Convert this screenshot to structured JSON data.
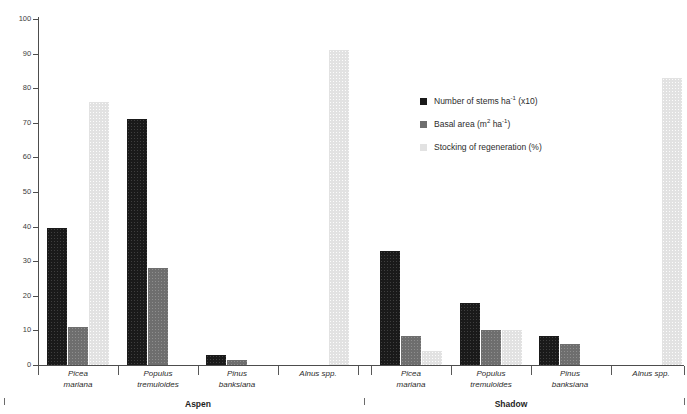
{
  "chart_data": {
    "type": "bar",
    "title": "",
    "xlabel": "",
    "ylabel": "",
    "ylim": [
      0,
      100
    ],
    "y_ticks": [
      0,
      10,
      20,
      30,
      40,
      50,
      60,
      70,
      80,
      90,
      100
    ],
    "grid": false,
    "legend_position": "upper-center-right",
    "categories": [
      "Picea mariana",
      "Populus tremuloides",
      "Pinus banksiana",
      "Alnus spp.",
      "Picea mariana",
      "Populus tremuloides",
      "Pinus banksiana",
      "Alnus spp."
    ],
    "groups": [
      {
        "label": "Aspen",
        "categories": [
          "Picea mariana",
          "Populus tremuloides",
          "Pinus banksiana",
          "Alnus spp."
        ]
      },
      {
        "label": "Shadow",
        "categories": [
          "Picea mariana",
          "Populus tremuloides",
          "Pinus banksiana",
          "Alnus spp."
        ]
      }
    ],
    "series": [
      {
        "name": "Number of stems ha-1 (x10)",
        "color": "#1a1a1a",
        "values": [
          39.5,
          71,
          3,
          0,
          33,
          18,
          8.5,
          0
        ]
      },
      {
        "name": "Basal area (m2 ha-1)",
        "color": "#6e6e6e",
        "values": [
          11,
          28,
          1.5,
          0,
          8.5,
          10,
          6,
          0
        ]
      },
      {
        "name": "Stocking of regeneration (%)",
        "color": "#e2e2e2",
        "values": [
          76,
          0,
          0,
          91,
          4,
          10,
          0,
          83
        ]
      }
    ]
  },
  "legend": {
    "items": [
      {
        "label_main": "Number of stems ha",
        "label_sup": "-1",
        "label_tail": " (x10)"
      },
      {
        "label_main": "Basal area (m",
        "label_sup": "2",
        "label_mid": " ha",
        "label_sup2": "-1",
        "label_tail": ")"
      },
      {
        "label_main": "Stocking of regeneration (%)",
        "label_sup": "",
        "label_tail": ""
      }
    ]
  },
  "axis": {
    "y_labels": [
      "100",
      "90",
      "80",
      "70",
      "60",
      "50",
      "40",
      "30",
      "20",
      "10",
      "0"
    ]
  },
  "categories_display": [
    {
      "line1": "Picea",
      "line2": "mariana"
    },
    {
      "line1": "Populus",
      "line2": "tremuloides"
    },
    {
      "line1": "Pinus",
      "line2": "banksiana"
    },
    {
      "line1": "Alnus spp.",
      "line2": ""
    },
    {
      "line1": "Picea",
      "line2": "mariana"
    },
    {
      "line1": "Populus",
      "line2": "tremuloides"
    },
    {
      "line1": "Pinus",
      "line2": "banksiana"
    },
    {
      "line1": "Alnus spp.",
      "line2": ""
    }
  ],
  "group_labels": [
    {
      "label": "Aspen"
    },
    {
      "label": "Shadow"
    }
  ]
}
